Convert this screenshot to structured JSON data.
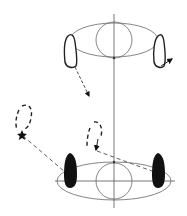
{
  "diagram": {
    "title": "Foot step movement diagram",
    "colors": {
      "line": "#555555",
      "foot_outline": "#222222",
      "foot_fill": "#111111",
      "dash": "#333333",
      "background": "#ffffff"
    },
    "elements": [
      {
        "id": "start-position",
        "type": "ellipse-with-circle",
        "feet": [
          "outline-left",
          "outline-right"
        ]
      },
      {
        "id": "end-position",
        "type": "ellipse-with-circle",
        "feet": [
          "filled-left",
          "filled-right"
        ]
      },
      {
        "id": "step-path-left",
        "type": "dashed-arrow"
      },
      {
        "id": "step-path-right",
        "type": "arrow"
      },
      {
        "id": "intermediate-foot-far",
        "type": "dashed-foot",
        "marker": "star"
      },
      {
        "id": "intermediate-foot-near",
        "type": "dashed-foot",
        "marker": "arrow"
      }
    ]
  }
}
